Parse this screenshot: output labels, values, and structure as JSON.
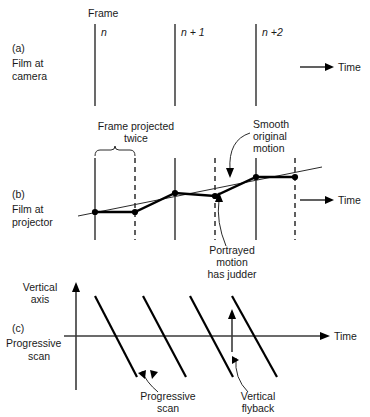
{
  "figure": {
    "title_visible": false,
    "sections": [
      {
        "id": "a",
        "tag": "(a)",
        "label_line1": "Film at",
        "label_line2": "camera",
        "axis_label": "Time",
        "header": "Frame",
        "frame_labels": [
          "n",
          "n + 1",
          "n +2"
        ],
        "frame_x": [
          95,
          175,
          256
        ],
        "frame_y_top": 24,
        "frame_y_bottom": 106,
        "arrow_y": 67,
        "arrow_x_start": 300,
        "arrow_x_end": 328
      },
      {
        "id": "b",
        "tag": "(b)",
        "label_line1": "Film at",
        "label_line2": "projector",
        "axis_label": "Time",
        "bracket_label_line1": "Frame projected",
        "bracket_label_line2": "twice",
        "annotation_smooth": [
          "Smooth",
          "original",
          "motion"
        ],
        "annotation_judder": [
          "Portrayed",
          "motion",
          "has judder"
        ],
        "solid_x": [
          95,
          175,
          256
        ],
        "dashed_x": [
          135,
          215,
          295
        ],
        "line_y_top": 158,
        "line_y_bottom": 240,
        "dots": [
          {
            "x": 95,
            "y": 212
          },
          {
            "x": 135,
            "y": 212
          },
          {
            "x": 175,
            "y": 193
          },
          {
            "x": 215,
            "y": 196
          },
          {
            "x": 256,
            "y": 177
          },
          {
            "x": 295,
            "y": 177
          }
        ],
        "smooth_line": {
          "x1": 78,
          "y1": 214,
          "x2": 320,
          "y2": 168
        },
        "bracket": {
          "x1": 95,
          "x2": 135,
          "y": 152
        },
        "arrow_y": 200,
        "arrow_x_start": 300,
        "arrow_x_end": 328
      },
      {
        "id": "c",
        "tag": "(c)",
        "label_line1": "Progressive",
        "label_line2": "scan",
        "axis_label": "Time",
        "vertical_axis_label_line1": "Vertical",
        "vertical_axis_label_line2": "axis",
        "annotation_progressive": [
          "Progressive",
          "scan"
        ],
        "annotation_flyback": [
          "Vertical",
          "flyback"
        ],
        "origin_x": 76,
        "axis_y": 336,
        "axis_x_end": 322,
        "axis_y_top": 293,
        "axis_y_bottom": 390,
        "scan_lines": [
          {
            "x1": 95,
            "y1": 296,
            "x2": 137,
            "y2": 377
          },
          {
            "x1": 143,
            "y1": 296,
            "x2": 186,
            "y2": 377
          },
          {
            "x1": 190,
            "y1": 296,
            "x2": 233,
            "y2": 377
          },
          {
            "x1": 232,
            "y1": 296,
            "x2": 277,
            "y2": 377
          }
        ],
        "flyback_arrow": {
          "x": 232,
          "y_bottom": 350,
          "y_top": 311
        }
      }
    ],
    "colors": {
      "ink": "#1a1a1a",
      "line": "#2b2b2b",
      "thick": "#000000",
      "background": "#ffffff"
    }
  }
}
